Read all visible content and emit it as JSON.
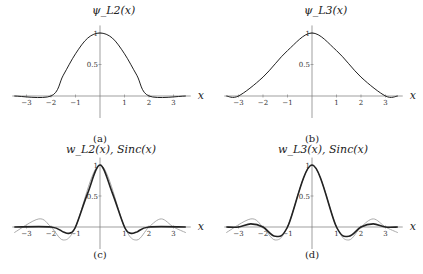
{
  "chart_data": [
    {
      "panel": "a",
      "type": "line",
      "title": "ψ_L2(x)",
      "caption": "(a)",
      "xlabel": "x",
      "ylabel": "",
      "xticks": [
        -3,
        -2,
        -1,
        1,
        2,
        3
      ],
      "yticks": [
        0.5,
        1
      ],
      "xlim": [
        -3.5,
        3.5
      ],
      "ylim": [
        -0.45,
        1.25
      ],
      "series": [
        {
          "name": "ψ_L2(x)",
          "color": "#222222",
          "support": [
            -2,
            2
          ],
          "x": [
            -3.5,
            -2,
            -1.5,
            -1,
            -0.5,
            0,
            0.5,
            1,
            1.5,
            2,
            3.5
          ],
          "values": [
            0,
            0,
            0.33,
            0.67,
            0.92,
            1,
            0.92,
            0.67,
            0.33,
            0,
            0
          ]
        }
      ]
    },
    {
      "panel": "b",
      "type": "line",
      "title": "ψ_L3(x)",
      "caption": "(b)",
      "xlabel": "x",
      "ylabel": "",
      "xticks": [
        -3,
        -2,
        -1,
        1,
        2,
        3
      ],
      "yticks": [
        0.5,
        1
      ],
      "xlim": [
        -3.5,
        3.5
      ],
      "ylim": [
        -0.45,
        1.25
      ],
      "series": [
        {
          "name": "ψ_L3(x)",
          "color": "#222222",
          "support": [
            -3,
            3
          ],
          "x": [
            -3.5,
            -3,
            -2,
            -1,
            0,
            1,
            2,
            3,
            3.5
          ],
          "values": [
            0,
            0,
            0.3,
            0.72,
            1,
            0.72,
            0.3,
            0,
            0
          ]
        }
      ]
    },
    {
      "panel": "c",
      "type": "line",
      "title": "w_L2(x), Sinc(x)",
      "caption": "(c)",
      "xlabel": "x",
      "ylabel": "",
      "xticks": [
        -3,
        -2,
        -1,
        1,
        2,
        3
      ],
      "yticks": [
        0.5,
        1
      ],
      "xlim": [
        -3.5,
        3.5
      ],
      "ylim": [
        -0.45,
        1.25
      ],
      "series": [
        {
          "name": "w_L2(x)",
          "color": "#222222",
          "width": 1.6,
          "x": [
            -3.5,
            -2,
            -1.5,
            -1.25,
            -1,
            -0.5,
            0,
            0.5,
            1,
            1.25,
            1.5,
            2,
            3.5
          ],
          "values": [
            0,
            0,
            -0.08,
            -0.1,
            0,
            0.55,
            1,
            0.55,
            0,
            -0.1,
            -0.08,
            0,
            0
          ]
        },
        {
          "name": "Sinc(x)",
          "color": "#aaaaaa",
          "width": 1,
          "x": [
            -3.5,
            -2.5,
            -2,
            -1.5,
            -1,
            0,
            1,
            1.5,
            2,
            2.5,
            3,
            3.5
          ],
          "values": [
            -0.09,
            0.13,
            0,
            -0.21,
            0,
            1,
            0,
            -0.21,
            0,
            0.13,
            0,
            -0.09
          ]
        }
      ]
    },
    {
      "panel": "d",
      "type": "line",
      "title": "w_L3(x), Sinc(x)",
      "caption": "(d)",
      "xlabel": "x",
      "ylabel": "",
      "xticks": [
        -3,
        -2,
        -1,
        1,
        2,
        3
      ],
      "yticks": [
        0.5,
        1
      ],
      "xlim": [
        -3.5,
        3.5
      ],
      "ylim": [
        -0.45,
        1.25
      ],
      "series": [
        {
          "name": "w_L3(x)",
          "color": "#222222",
          "width": 1.6,
          "x": [
            -3.5,
            -3,
            -2.5,
            -2,
            -1.5,
            -1,
            0,
            1,
            1.5,
            2,
            2.5,
            3,
            3.5
          ],
          "values": [
            0,
            0,
            0.05,
            0,
            -0.15,
            0,
            1,
            0,
            -0.15,
            0,
            0.05,
            0,
            0
          ]
        },
        {
          "name": "Sinc(x)",
          "color": "#aaaaaa",
          "width": 1,
          "x": [
            -3.5,
            -2.5,
            -2,
            -1.5,
            -1,
            0,
            1,
            1.5,
            2,
            2.5,
            3,
            3.5
          ],
          "values": [
            -0.09,
            0.13,
            0,
            -0.21,
            0,
            1,
            0,
            -0.21,
            0,
            0.13,
            0,
            -0.09
          ]
        }
      ]
    }
  ]
}
